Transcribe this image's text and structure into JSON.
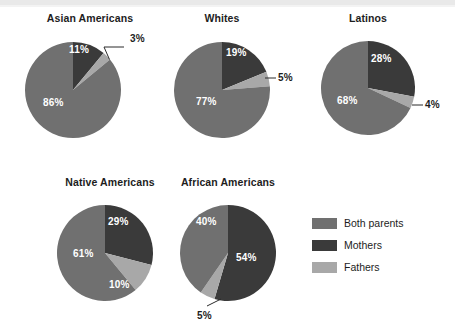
{
  "chart_data": {
    "type": "pie",
    "title": "",
    "subtitle": "",
    "legend_position": "bottom-right",
    "categories": [
      "Both parents",
      "Mothers",
      "Fathers"
    ],
    "colors": {
      "both_parents": "#707070",
      "mothers": "#3a3a3a",
      "fathers": "#a8a8a8"
    },
    "charts": [
      {
        "title": "Asian Americans",
        "slices": [
          {
            "label": "Mothers",
            "value": 11,
            "display": "11%",
            "color": "#3a3a3a",
            "callout": false
          },
          {
            "label": "Fathers",
            "value": 3,
            "display": "3%",
            "color": "#a8a8a8",
            "callout": true
          },
          {
            "label": "Both parents",
            "value": 86,
            "display": "86%",
            "color": "#707070",
            "callout": false
          }
        ]
      },
      {
        "title": "Whites",
        "slices": [
          {
            "label": "Mothers",
            "value": 19,
            "display": "19%",
            "color": "#3a3a3a",
            "callout": false
          },
          {
            "label": "Fathers",
            "value": 5,
            "display": "5%",
            "color": "#a8a8a8",
            "callout": true
          },
          {
            "label": "Both parents",
            "value": 77,
            "display": "77%",
            "color": "#707070",
            "callout": false
          }
        ]
      },
      {
        "title": "Latinos",
        "slices": [
          {
            "label": "Mothers",
            "value": 28,
            "display": "28%",
            "color": "#3a3a3a",
            "callout": false
          },
          {
            "label": "Fathers",
            "value": 4,
            "display": "4%",
            "color": "#a8a8a8",
            "callout": true
          },
          {
            "label": "Both parents",
            "value": 68,
            "display": "68%",
            "color": "#707070",
            "callout": false
          }
        ]
      },
      {
        "title": "Native Americans",
        "slices": [
          {
            "label": "Mothers",
            "value": 29,
            "display": "29%",
            "color": "#3a3a3a",
            "callout": false
          },
          {
            "label": "Fathers",
            "value": 10,
            "display": "10%",
            "color": "#a8a8a8",
            "callout": false
          },
          {
            "label": "Both parents",
            "value": 61,
            "display": "61%",
            "color": "#707070",
            "callout": false
          }
        ]
      },
      {
        "title": "African Americans",
        "slices": [
          {
            "label": "Mothers",
            "value": 54,
            "display": "54%",
            "color": "#3a3a3a",
            "callout": false
          },
          {
            "label": "Fathers",
            "value": 5,
            "display": "5%",
            "color": "#a8a8a8",
            "callout": true
          },
          {
            "label": "Both parents",
            "value": 40,
            "display": "40%",
            "color": "#707070",
            "callout": false
          }
        ]
      }
    ]
  },
  "legend": {
    "items": [
      {
        "label": "Both parents",
        "color": "#707070"
      },
      {
        "label": "Mothers",
        "color": "#3a3a3a"
      },
      {
        "label": "Fathers",
        "color": "#a8a8a8"
      }
    ]
  }
}
